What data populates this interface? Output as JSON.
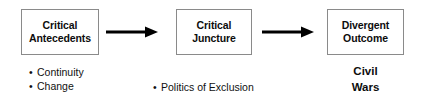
{
  "diagram": {
    "colors": {
      "background": "#ffffff",
      "box_border": "#8a8a8a",
      "text": "#0d0d0d",
      "arrow": "#000000"
    },
    "nodes": [
      {
        "id": "antecedents",
        "label": "Critical\nAntecedents",
        "annotation_kind": "bullet-list",
        "annotation_items": [
          "Continuity",
          "Change"
        ]
      },
      {
        "id": "juncture",
        "label": "Critical\nJuncture",
        "annotation_kind": "bullet-list",
        "annotation_items": [
          "Politics of Exclusion"
        ]
      },
      {
        "id": "outcome",
        "label": "Divergent\nOutcome",
        "annotation_kind": "plain-text",
        "annotation_text": "Civil\nWars"
      }
    ],
    "connectors": [
      {
        "id": "arrow-1",
        "from": "antecedents",
        "to": "juncture",
        "style": "solid-arrow-right"
      },
      {
        "id": "arrow-2",
        "from": "juncture",
        "to": "outcome",
        "style": "solid-arrow-right"
      }
    ],
    "bullet_glyph": "•"
  }
}
